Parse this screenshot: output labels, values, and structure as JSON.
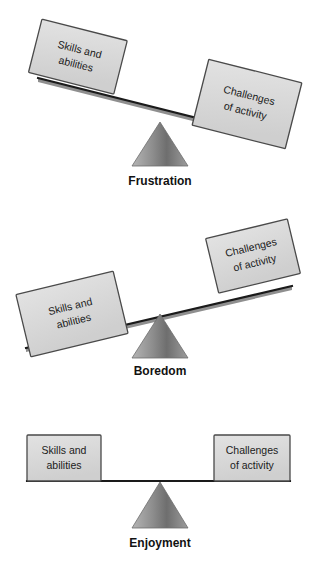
{
  "figure": {
    "background_color": "#ffffff",
    "box_fill_color": "#d9d9d9",
    "box_stroke_color": "#4a4a4a",
    "beam_color": "#1a1a1a",
    "fulcrum_light_color": "#b3b3b3",
    "fulcrum_dark_color": "#6e6e6e",
    "caption_color": "#121212"
  },
  "labels": {
    "skills": {
      "line1": "Skills and",
      "line2": "abilities"
    },
    "challenges": {
      "line1": "Challenges",
      "line2": "of activity"
    }
  },
  "diagrams": [
    {
      "id": "frustration",
      "caption": "Frustration",
      "state": "challenges-exceed-skills",
      "tilt_direction": "down-right",
      "beam_angle_deg": 14,
      "left_box": "skills",
      "right_box": "challenges",
      "left_box_label_line1": "Skills and",
      "left_box_label_line2": "abilities",
      "right_box_label_line1": "Challenges",
      "right_box_label_line2": "of activity"
    },
    {
      "id": "boredom",
      "caption": "Boredom",
      "state": "skills-exceed-challenges",
      "tilt_direction": "down-left",
      "beam_angle_deg": -14,
      "left_box": "skills",
      "right_box": "challenges",
      "left_box_label_line1": "Skills and",
      "left_box_label_line2": "abilities",
      "right_box_label_line1": "Challenges",
      "right_box_label_line2": "of activity"
    },
    {
      "id": "enjoyment",
      "caption": "Enjoyment",
      "state": "balanced",
      "tilt_direction": "level",
      "beam_angle_deg": 0,
      "left_box": "skills",
      "right_box": "challenges",
      "left_box_label_line1": "Skills and",
      "left_box_label_line2": "abilities",
      "right_box_label_line1": "Challenges",
      "right_box_label_line2": "of activity"
    }
  ]
}
